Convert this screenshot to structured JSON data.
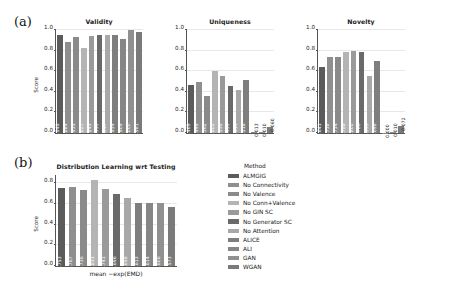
{
  "panels": {
    "a": {
      "tag": "(a)"
    },
    "b": {
      "tag": "(b)"
    }
  },
  "methods": [
    "ALMGIG",
    "No Connectivity",
    "No Valence",
    "No Conn+Valence",
    "No GIN SC",
    "No Generator SC",
    "No Attention",
    "ALICE",
    "ALI",
    "GAN",
    "WGAN"
  ],
  "palette": [
    "#5b5b5b",
    "#8f8f8f",
    "#8a8a8a",
    "#b4b4b4",
    "#9a9a9a",
    "#6a6a6a",
    "#a8a8a8",
    "#7e7e7e",
    "#868686",
    "#909090",
    "#7a7a7a"
  ],
  "legend": {
    "title": "Method",
    "items": [
      {
        "label": "ALMGIG",
        "color": "#5b5b5b"
      },
      {
        "label": "No Connectivity",
        "color": "#8f8f8f"
      },
      {
        "label": "No Valence",
        "color": "#8a8a8a"
      },
      {
        "label": "No Conn+Valence",
        "color": "#b4b4b4"
      },
      {
        "label": "No GIN SC",
        "color": "#9a9a9a"
      },
      {
        "label": "No Generator SC",
        "color": "#6a6a6a"
      },
      {
        "label": "No Attention",
        "color": "#a8a8a8"
      },
      {
        "label": "ALICE",
        "color": "#7e7e7e"
      },
      {
        "label": "ALI",
        "color": "#868686"
      },
      {
        "label": "GAN",
        "color": "#909090"
      },
      {
        "label": "WGAN",
        "color": "#7a7a7a"
      }
    ]
  },
  "chart_data": [
    {
      "type": "bar",
      "title": "Validity",
      "xlabel": "",
      "ylabel": "Score",
      "ylim": [
        0.0,
        1.0
      ],
      "yticks": [
        "0.0",
        "0.2",
        "0.4",
        "0.6",
        "0.8",
        "1.0"
      ],
      "categories": [
        "ALMGIG",
        "No Connectivity",
        "No Valence",
        "No Conn+Valence",
        "No GIN SC",
        "No Generator SC",
        "No Attention",
        "ALICE",
        "ALI",
        "GAN",
        "WGAN"
      ],
      "values": [
        0.949,
        0.884,
        0.935,
        0.827,
        0.945,
        0.955,
        0.947,
        0.954,
        0.909,
        1.0,
        0.981
      ],
      "labels": [
        "0.949",
        "0.884",
        "0.935",
        "0.827",
        "0.945",
        "0.955",
        "0.947",
        "0.954",
        "0.909",
        "1.000",
        "0.981"
      ],
      "grid": true,
      "legend_position": "none"
    },
    {
      "type": "bar",
      "title": "Uniqueness",
      "xlabel": "",
      "ylabel": "",
      "ylim": [
        0.0,
        1.0
      ],
      "yticks": [
        "0.0",
        "0.2",
        "0.4",
        "0.6",
        "0.8",
        "1.0"
      ],
      "categories": [
        "ALMGIG",
        "No Connectivity",
        "No Valence",
        "No Conn+Valence",
        "No GIN SC",
        "No Generator SC",
        "No Attention",
        "ALICE",
        "ALI",
        "GAN",
        "WGAN"
      ],
      "values": [
        0.469,
        0.499,
        0.362,
        0.602,
        0.556,
        0.459,
        0.414,
        0.518,
        0.013,
        0.01,
        0.06
      ],
      "labels": [
        "0.469",
        "0.499",
        "0.362",
        "0.602",
        "0.556",
        "0.459",
        "0.414",
        "0.518",
        "0.013",
        "0.010",
        "0.060"
      ],
      "grid": true,
      "legend_position": "none"
    },
    {
      "type": "bar",
      "title": "Novelty",
      "xlabel": "",
      "ylabel": "",
      "ylim": [
        0.0,
        1.0
      ],
      "yticks": [
        "0.0",
        "0.2",
        "0.4",
        "0.6",
        "0.8",
        "1.0"
      ],
      "categories": [
        "ALMGIG",
        "No Connectivity",
        "No Valence",
        "No Conn+Valence",
        "No GIN SC",
        "No Generator SC",
        "No Attention",
        "ALICE",
        "ALI",
        "GAN",
        "WGAN"
      ],
      "values": [
        0.641,
        0.738,
        0.734,
        0.788,
        0.8,
        0.786,
        0.555,
        0.698,
        0.0,
        0.01,
        0.072
      ],
      "labels": [
        "0.641",
        "0.738",
        "0.734",
        "0.788",
        "0.800",
        "0.786",
        "0.555",
        "0.698",
        "0.000",
        "0.010",
        "0.072"
      ],
      "grid": true,
      "legend_position": "none"
    },
    {
      "type": "bar",
      "title": "Distribution Learning wrt Testing",
      "xlabel": "mean −exp(EMD)",
      "ylabel": "Score",
      "ylim": [
        0.0,
        0.88
      ],
      "yticks": [
        "0.0",
        "0.2",
        "0.4",
        "0.6",
        "0.8"
      ],
      "categories": [
        "ALMGIG",
        "No Connectivity",
        "No Valence",
        "No Conn+Valence",
        "No GIN SC",
        "No Generator SC",
        "No Attention",
        "ALICE",
        "ALI",
        "GAN",
        "WGAN"
      ],
      "values": [
        0.753,
        0.767,
        0.736,
        0.833,
        0.741,
        0.696,
        0.658,
        0.613,
        0.614,
        0.606,
        0.573
      ],
      "labels": [
        "0.753",
        "0.767",
        "0.736",
        "0.833",
        "0.741",
        "0.696",
        "0.658",
        "0.613",
        "0.614",
        "0.606",
        "0.573"
      ],
      "grid": true,
      "legend_position": "right"
    }
  ]
}
